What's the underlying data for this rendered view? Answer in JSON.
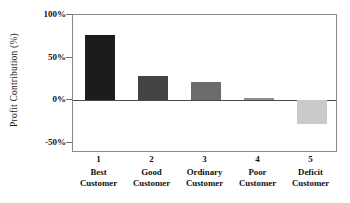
{
  "chart_data": {
    "type": "bar",
    "title": "",
    "xlabel": "",
    "ylabel": "Profit Contribution (%)",
    "categories": [
      "Best Customer",
      "Good Customer",
      "Ordinary Customer",
      "Poor Customer",
      "Deficit Customer"
    ],
    "category_numbers": [
      "1",
      "2",
      "3",
      "4",
      "5"
    ],
    "category_lines": [
      [
        "Best",
        "Customer"
      ],
      [
        "Good",
        "Customer"
      ],
      [
        "Ordinary",
        "Customer"
      ],
      [
        "Poor",
        "Customer"
      ],
      [
        "Deficit",
        "Customer"
      ]
    ],
    "values": [
      77,
      28,
      21,
      3,
      -28
    ],
    "value_labels": [
      "77%",
      "28%",
      "21%",
      "3%",
      "-28%"
    ],
    "bar_colors": [
      "#1c1c1c",
      "#434343",
      "#6b6b6b",
      "#8f8f8f",
      "#c9c9c9"
    ],
    "ylim": [
      -62,
      100
    ],
    "yticks": [
      100,
      50,
      0,
      -50
    ],
    "ytick_labels": [
      "100%",
      "50%",
      "0%",
      "-50%"
    ],
    "grid": false,
    "legend": false,
    "zero_line": true,
    "frame": true
  },
  "axis": {
    "y_title": "Profit Contribution (%)"
  }
}
